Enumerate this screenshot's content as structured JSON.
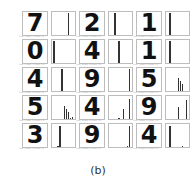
{
  "figure_caption": "(b)",
  "chart_data": {
    "type": "bar",
    "title": "(b)",
    "categories": [
      "0",
      "1",
      "2",
      "3",
      "4",
      "5",
      "6",
      "7",
      "8",
      "9"
    ],
    "panels": [
      {
        "digit": "7",
        "values": [
          0,
          0,
          0,
          0,
          0,
          0,
          0,
          1.0,
          0,
          0
        ]
      },
      {
        "digit": "2",
        "values": [
          0,
          0,
          1.0,
          0,
          0,
          0,
          0,
          0,
          0,
          0
        ]
      },
      {
        "digit": "1",
        "values": [
          0,
          1.0,
          0,
          0,
          0,
          0,
          0,
          0,
          0,
          0
        ]
      },
      {
        "digit": "0",
        "values": [
          1.0,
          0,
          0,
          0,
          0,
          0,
          0,
          0,
          0,
          0
        ]
      },
      {
        "digit": "4",
        "values": [
          0,
          0,
          0,
          0,
          1.0,
          0,
          0,
          0,
          0,
          0
        ]
      },
      {
        "digit": "1",
        "values": [
          0,
          1.0,
          0,
          0,
          0,
          0,
          0,
          0,
          0,
          0
        ]
      },
      {
        "digit": "4",
        "values": [
          0,
          0,
          0,
          0,
          1.0,
          0,
          0,
          0,
          0,
          0
        ]
      },
      {
        "digit": "9",
        "values": [
          0,
          0,
          0,
          0,
          0,
          0,
          0,
          0,
          0,
          1.0
        ]
      },
      {
        "digit": "5",
        "values": [
          0,
          0,
          0,
          0,
          0,
          0.6,
          0.45,
          0.3,
          0,
          0
        ]
      },
      {
        "digit": "5",
        "values": [
          0,
          0,
          0,
          0,
          0,
          0.6,
          0.45,
          0.3,
          0.05,
          0.1
        ]
      },
      {
        "digit": "4",
        "values": [
          0,
          0,
          0,
          0,
          0.05,
          0,
          0.45,
          0,
          0,
          0.9
        ]
      },
      {
        "digit": "9",
        "values": [
          0,
          0,
          0,
          0,
          0,
          0.55,
          0,
          0,
          0,
          0.85
        ]
      },
      {
        "digit": "3",
        "values": [
          0,
          0,
          0.05,
          0.95,
          0,
          0,
          0,
          0,
          0,
          0
        ]
      },
      {
        "digit": "9",
        "values": [
          0.02,
          0,
          0.02,
          0,
          0.02,
          0,
          0.02,
          0,
          0.05,
          0.95
        ]
      },
      {
        "digit": "4",
        "values": [
          0,
          0.95,
          0,
          0,
          0,
          0,
          0,
          0.05,
          0,
          0
        ]
      }
    ],
    "xlabel": "",
    "ylabel": "",
    "ylim": [
      0,
      1
    ]
  },
  "panel_captions": [
    "true: 7 pred: 7 score: 0.9",
    "true: 2 pred: 2 score: 0.9",
    "true: 1 pred: 1 score: 0.9",
    "true: 0 pred: 0 score: 0.9",
    "true: 4 pred: 4 score: 0.9",
    "true: 1 pred: 1 score: 0.9",
    "true: 4 pred: 4 score: 0.9",
    "true: 9 pred: 9 score: 0.9",
    "true: 5 pred: 5 score: 0.6",
    "true: 5 pred: 5 score: 0.6",
    "true: 4 pred: 9 score: 0.9",
    "true: 9 pred: 9 score: 0.8",
    "true: 3 pred: 3 score: 0.9",
    "true: 9 pred: 9 score: 0.9",
    "true: 4 pred: 1 score: 0.9"
  ]
}
